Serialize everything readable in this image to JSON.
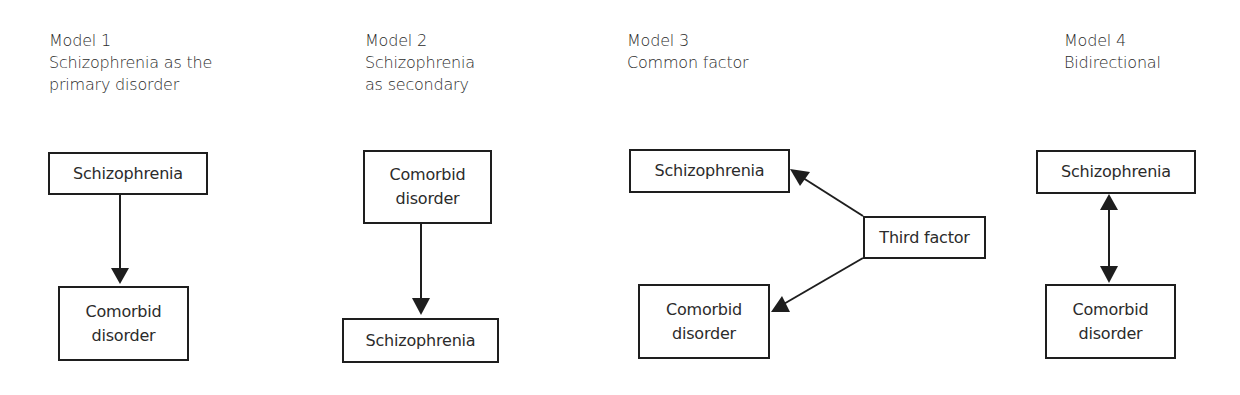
{
  "models": [
    {
      "title": "Model 1",
      "subtitle_lines": [
        "Schizophrenia as the",
        "primary disorder"
      ],
      "nodes": {
        "top": "Schizophrenia",
        "bottom": "Comorbid\ndisorder"
      },
      "relation": "top -> bottom"
    },
    {
      "title": "Model 2",
      "subtitle_lines": [
        "Schizophrenia",
        "as secondary"
      ],
      "nodes": {
        "top": "Comorbid\ndisorder",
        "bottom": "Schizophrenia"
      },
      "relation": "top -> bottom"
    },
    {
      "title": "Model 3",
      "subtitle_lines": [
        "Common factor"
      ],
      "nodes": {
        "top": "Schizophrenia",
        "factor": "Third factor",
        "bottom": "Comorbid\ndisorder"
      },
      "relation": "factor -> top; factor -> bottom"
    },
    {
      "title": "Model 4",
      "subtitle_lines": [
        "Bidirectional"
      ],
      "nodes": {
        "top": "Schizophrenia",
        "bottom": "Comorbid\ndisorder"
      },
      "relation": "top <-> bottom"
    }
  ],
  "colors": {
    "line": "#1e1e1e",
    "text": "#2b2b2b",
    "background": "#ffffff"
  }
}
